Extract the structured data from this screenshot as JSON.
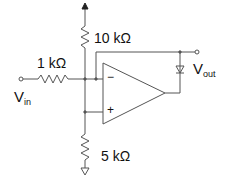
{
  "circuit": {
    "type": "op-amp precision rectifier (inverting half-wave)",
    "labels": {
      "r_input": "1 kΩ",
      "r_feedback": "10 kΩ",
      "r_ground": "5 kΩ",
      "vin_main": "V",
      "vin_sub": "in",
      "vout_main": "V",
      "vout_sub": "out",
      "minus": "−",
      "plus": "+"
    },
    "colors": {
      "wire": "#555555",
      "text": "#111111"
    }
  }
}
